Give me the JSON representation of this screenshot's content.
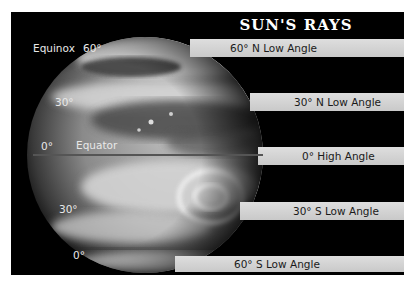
{
  "title": "SUN'S RAYS",
  "left_labels": {
    "equinox": "Equinox",
    "lat_60_n": "60°",
    "lat_30_n": "30°",
    "lat_0": "0°",
    "equator": "Equator",
    "lat_30_s": "30°",
    "lat_0_bottom": "0°"
  },
  "rays": [
    {
      "label": "60° N Low Angle"
    },
    {
      "label": "30° N Low Angle"
    },
    {
      "label": "0° High Angle"
    },
    {
      "label": "30° S Low Angle"
    },
    {
      "label": "60° S Low Angle"
    }
  ],
  "colors": {
    "background": "#000000",
    "ray_band": "#d4d4d4",
    "text_light": "#e8e8e8",
    "text_dark": "#1a1a1a"
  }
}
